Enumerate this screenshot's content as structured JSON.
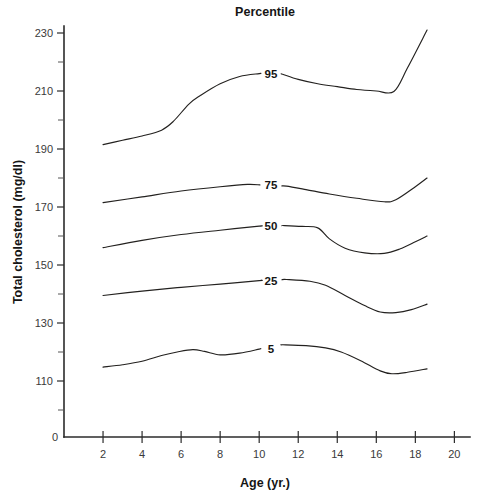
{
  "chart_data": {
    "type": "line",
    "title": "Percentile",
    "xlabel": "Age (yr.)",
    "ylabel": "Total cholesterol (mg/dl)",
    "xlim": [
      0,
      20.8
    ],
    "ylim": [
      100,
      236
    ],
    "grid": false,
    "legend_position": "inline-right-of-curves",
    "x_ticks": [
      2,
      4,
      6,
      8,
      10,
      12,
      14,
      16,
      18,
      20
    ],
    "x_tick_labels": [
      "2",
      "4",
      "6",
      "8",
      "10",
      "12",
      "14",
      "16",
      "18",
      "20"
    ],
    "y_ticks": [
      110,
      130,
      150,
      170,
      190,
      210,
      230
    ],
    "y_tick_labels": [
      "110",
      "130",
      "150",
      "170",
      "190",
      "210",
      "230"
    ],
    "y_minor_ticks": [
      100,
      120,
      140,
      160,
      180,
      200,
      220
    ],
    "y_axis_break_label": "0",
    "y_axis_break_note": "axis broken between 0 and 100",
    "series": [
      {
        "name": "95",
        "label": "95",
        "label_x": 10.6,
        "label_y": 216.5,
        "x": [
          2.0,
          3.0,
          4.0,
          5.0,
          5.6,
          6.4,
          7.0,
          8.0,
          9.0,
          10.0,
          11.2,
          12.0,
          13.0,
          14.0,
          15.0,
          16.0,
          16.9,
          17.6,
          18.6
        ],
        "y": [
          191.5,
          193.0,
          194.5,
          196.5,
          199.5,
          205.5,
          208.5,
          212.5,
          215.0,
          216.0,
          215.8,
          214.0,
          212.5,
          211.5,
          210.5,
          210.0,
          209.8,
          218.0,
          231.0
        ]
      },
      {
        "name": "75",
        "label": "75",
        "label_x": 10.6,
        "label_y": 178.0,
        "x": [
          2.0,
          4.0,
          6.0,
          8.0,
          9.4,
          11.4,
          12.4,
          13.6,
          15.0,
          16.4,
          17.0,
          18.0,
          18.6
        ],
        "y": [
          171.5,
          173.5,
          175.5,
          177.0,
          177.8,
          177.2,
          176.0,
          174.5,
          173.0,
          171.8,
          172.5,
          177.0,
          180.0
        ]
      },
      {
        "name": "50",
        "label": "50",
        "label_x": 10.6,
        "label_y": 164.0,
        "x": [
          2.0,
          4.0,
          6.0,
          8.0,
          10.0,
          11.3,
          12.2,
          13.0,
          13.6,
          14.4,
          15.4,
          16.4,
          17.2,
          18.0,
          18.6
        ],
        "y": [
          156.0,
          158.5,
          160.5,
          162.0,
          163.4,
          163.6,
          163.3,
          162.8,
          159.0,
          155.8,
          154.2,
          154.0,
          155.5,
          158.0,
          160.0
        ]
      },
      {
        "name": "25",
        "label": "25",
        "label_x": 10.6,
        "label_y": 147.5,
        "x": [
          2.0,
          4.0,
          6.0,
          8.0,
          10.0,
          11.4,
          12.6,
          13.4,
          14.4,
          15.4,
          16.2,
          17.0,
          17.8,
          18.6
        ],
        "y": [
          139.5,
          141.0,
          142.3,
          143.4,
          144.6,
          145.0,
          144.4,
          143.0,
          139.5,
          136.0,
          133.8,
          133.6,
          134.6,
          136.5
        ]
      },
      {
        "name": "5",
        "label": "5",
        "label_x": 10.6,
        "label_y": 124.5,
        "x": [
          2.0,
          3.0,
          4.0,
          5.0,
          5.8,
          6.6,
          7.2,
          8.0,
          9.0,
          10.0,
          11.2,
          12.4,
          13.4,
          14.2,
          15.2,
          16.2,
          16.8,
          17.6,
          18.6
        ],
        "y": [
          114.8,
          115.6,
          116.8,
          118.8,
          120.0,
          120.8,
          120.2,
          119.0,
          119.6,
          121.0,
          122.5,
          122.2,
          121.4,
          120.0,
          117.0,
          113.5,
          112.5,
          113.0,
          114.2
        ]
      }
    ]
  },
  "colors": {
    "axis": "#2b2b2b",
    "curve": "#23211f",
    "text": "#151515",
    "background": "#ffffff"
  }
}
